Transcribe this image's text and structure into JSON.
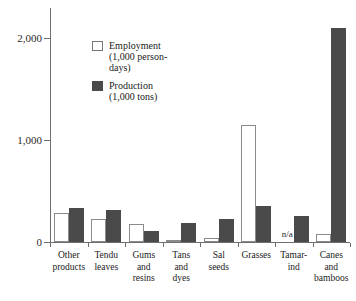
{
  "chart_data": {
    "type": "bar",
    "title": "",
    "subtitle": "",
    "xlabel": "",
    "ylabel": "",
    "ylim": [
      0,
      2400
    ],
    "yticks": [
      0,
      1000,
      2000
    ],
    "ytick_labels": [
      "0",
      "1,000",
      "2,000"
    ],
    "grid": false,
    "legend_position": "upper-left-inside",
    "categories": [
      "Other products",
      "Tendu leaves",
      "Gums and resins",
      "Tans and dyes",
      "Sal seeds",
      "Grasses",
      "Tamarind",
      "Canes and bamboos"
    ],
    "category_label_lines": [
      [
        "Other",
        "products"
      ],
      [
        "Tendu",
        "leaves"
      ],
      [
        "Gums",
        "and",
        "resins"
      ],
      [
        "Tans",
        "and",
        "dyes"
      ],
      [
        "Sal",
        "seeds"
      ],
      [
        "Grasses"
      ],
      [
        "Tamar-",
        "ind"
      ],
      [
        "Canes",
        "and",
        "bamboos"
      ]
    ],
    "series": [
      {
        "name": "Employment (1,000 person-days)",
        "color": "#ffffff",
        "edge_color": "#8a8a8a",
        "values": [
          300,
          240,
          180,
          20,
          40,
          1200,
          null,
          80
        ]
      },
      {
        "name": "Production (1,000 tons)",
        "color": "#4a4a4a",
        "edge_color": "#4a4a4a",
        "values": [
          350,
          330,
          110,
          190,
          240,
          370,
          270,
          2200
        ]
      }
    ],
    "annotations": [
      {
        "text": "n/a",
        "category": "Tamarind",
        "series": "Employment (1,000 person-days)",
        "note": "no data for employment in tamarind"
      }
    ]
  },
  "legend": {
    "items": [
      {
        "label_line1": "Employment",
        "label_line2": "(1,000 person-",
        "label_line3": "days)",
        "swatch": "employment-swatch"
      },
      {
        "label_line1": "Production",
        "label_line2": "(1,000 tons)",
        "label_line3": "",
        "swatch": "production-swatch"
      }
    ]
  },
  "axis": {
    "y_tick_0": "0",
    "y_tick_1000": "1,000",
    "y_tick_2000": "2,000"
  },
  "na_text": "n/a"
}
